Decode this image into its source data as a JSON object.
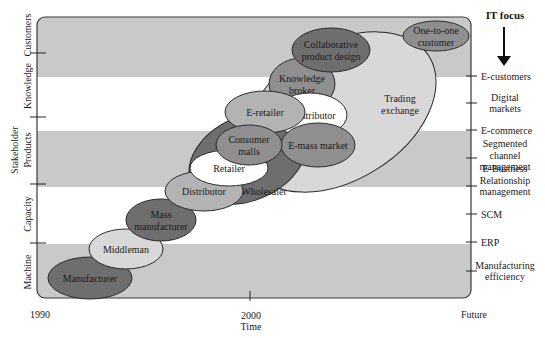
{
  "diagram": {
    "y_axis": {
      "title": "Stakeholder",
      "levels": [
        "Machine",
        "Capacity",
        "Products",
        "Knowledge",
        "Customers"
      ]
    },
    "x_axis": {
      "title": "Time",
      "ticks": [
        "1990",
        "2000",
        "Future"
      ]
    },
    "it_focus": {
      "title": "IT focus",
      "labels": [
        [
          "E-customers"
        ],
        [
          "Digital",
          "markets"
        ],
        [
          "E-commerce"
        ],
        [
          "Segmented",
          "channel",
          "management"
        ],
        [
          "E-Business",
          "Relationship",
          "management"
        ],
        [
          "SCM"
        ],
        [
          "ERP"
        ],
        [
          "Manufacturing",
          "efficiency"
        ]
      ]
    },
    "nodes": [
      {
        "id": "trading-exchange",
        "lines": [
          "Trading",
          "exchange"
        ],
        "shade": "light"
      },
      {
        "id": "wholesaler",
        "lines": [
          "Wholesaler"
        ],
        "shade": "dark"
      },
      {
        "id": "manufacturer",
        "lines": [
          "Manufacturer"
        ],
        "shade": "dark"
      },
      {
        "id": "middleman",
        "lines": [
          "Middleman"
        ],
        "shade": "light"
      },
      {
        "id": "mass-manufacturer",
        "lines": [
          "Mass",
          "manufacturer"
        ],
        "shade": "dark"
      },
      {
        "id": "distributor",
        "lines": [
          "Distributor"
        ],
        "shade": "medium"
      },
      {
        "id": "retailer",
        "lines": [
          "Retailer"
        ],
        "shade": "white"
      },
      {
        "id": "knowledge-broker",
        "lines": [
          "Knowledge",
          "broker"
        ],
        "shade": "medium-dark"
      },
      {
        "id": "e-distributor",
        "lines": [
          "E-distributor"
        ],
        "shade": "white"
      },
      {
        "id": "e-retailer",
        "lines": [
          "E-retailer"
        ],
        "shade": "medium"
      },
      {
        "id": "e-mass-market",
        "lines": [
          "E-mass market"
        ],
        "shade": "medium-dark"
      },
      {
        "id": "consumer-malls",
        "lines": [
          "Consumer",
          "malls"
        ],
        "shade": "medium-dark"
      },
      {
        "id": "collaborative-product-design",
        "lines": [
          "Collaborative",
          "product design"
        ],
        "shade": "dark"
      },
      {
        "id": "one-to-one-customer",
        "lines": [
          "One-to-one",
          "customer"
        ],
        "shade": "medium-dark"
      }
    ],
    "colors": {
      "band_gray": "#c9c9c9",
      "band_white": "#ffffff",
      "white": "#ffffff",
      "light": "#d8d8d8",
      "medium": "#b3b3b3",
      "medium-dark": "#8f8f8f",
      "dark": "#6e6e6e",
      "stroke": "#2a2a2a"
    }
  }
}
